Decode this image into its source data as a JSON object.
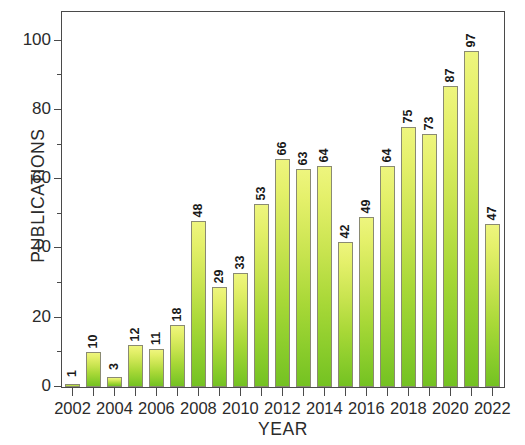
{
  "chart_data": {
    "type": "bar",
    "title": "",
    "xlabel": "YEAR",
    "ylabel": "PUBLICATIONS",
    "categories": [
      "2002",
      "2003",
      "2004",
      "2005",
      "2006",
      "2007",
      "2008",
      "2009",
      "2010",
      "2011",
      "2012",
      "2013",
      "2014",
      "2015",
      "2016",
      "2017",
      "2018",
      "2019",
      "2020",
      "2021",
      "2022"
    ],
    "values": [
      1,
      10,
      3,
      12,
      11,
      18,
      48,
      29,
      33,
      53,
      66,
      63,
      64,
      42,
      49,
      64,
      75,
      73,
      87,
      97,
      47
    ],
    "xlim": [
      2001,
      2023
    ],
    "ylim": [
      0,
      108
    ],
    "y_major_ticks": [
      0,
      20,
      40,
      60,
      80,
      100
    ],
    "y_minor_ticks": [
      10,
      30,
      50,
      70,
      90
    ],
    "y_tick_labels": [
      "0",
      "20",
      "40",
      "60",
      "80",
      "100"
    ],
    "x_tick_labels": [
      "2002",
      "2004",
      "2006",
      "2008",
      "2010",
      "2012",
      "2014",
      "2016",
      "2018",
      "2020",
      "2022"
    ],
    "grid": false,
    "legend": null,
    "bar_label_orientation": "vertical",
    "colors": {
      "bar_gradient_top": "#eef57e",
      "bar_gradient_bottom": "#74c222",
      "bar_outline": "#8a8a72",
      "axis": "#4a4a4a",
      "text": "#2b2b2b",
      "background": "#ffffff"
    }
  }
}
